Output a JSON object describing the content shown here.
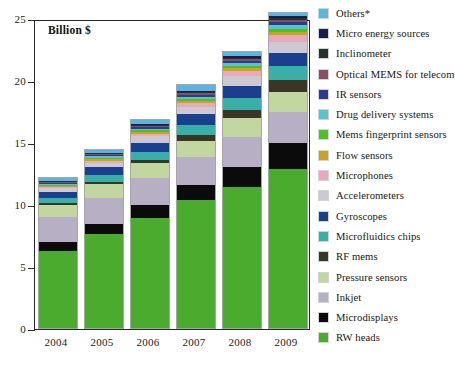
{
  "chart_data": {
    "type": "bar",
    "stacked": true,
    "title": "",
    "annotation": "Billion $",
    "xlabel": "",
    "ylabel": "",
    "ylim": [
      0,
      25
    ],
    "yticks": [
      0,
      5,
      10,
      15,
      20,
      25
    ],
    "ytick_labels": [
      "0",
      "5",
      "10",
      "15",
      "20",
      "25"
    ],
    "grid": true,
    "legend_position": "right",
    "legend_order_top_to_bottom": [
      "Others*",
      "Micro energy sources",
      "Inclinometer",
      "Optical MEMS for telecom",
      "IR sensors",
      "Drug delivery systems",
      "Mems fingerprint sensors",
      "Flow sensors",
      "Microphones",
      "Accelerometers",
      "Gyroscopes",
      "Microfluidics chips",
      "RF mems",
      "Pressure sensors",
      "Inkjet",
      "Microdisplays",
      "RW heads"
    ],
    "categories": [
      "2004",
      "2005",
      "2006",
      "2007",
      "2008",
      "2009"
    ],
    "totals": [
      12.1,
      14.4,
      16.8,
      19.5,
      22.2,
      25.1
    ],
    "series": [
      {
        "name": "RW heads",
        "color": "#4aab2e",
        "values": [
          6.2,
          7.6,
          8.9,
          10.3,
          11.4,
          12.8
        ]
      },
      {
        "name": "Microdisplays",
        "color": "#0b0b0b",
        "values": [
          0.75,
          0.8,
          1.0,
          1.2,
          1.6,
          2.1
        ]
      },
      {
        "name": "Inkjet",
        "color": "#b7b0c4",
        "values": [
          2.0,
          2.1,
          2.2,
          2.3,
          2.4,
          2.5
        ]
      },
      {
        "name": "Pressure sensors",
        "color": "#c2d6a0",
        "values": [
          1.0,
          1.1,
          1.2,
          1.3,
          1.5,
          1.6
        ]
      },
      {
        "name": "RF mems",
        "color": "#3b3525",
        "values": [
          0.12,
          0.2,
          0.25,
          0.45,
          0.7,
          1.0
        ]
      },
      {
        "name": "Microfluidics chips",
        "color": "#38b0a8",
        "values": [
          0.45,
          0.55,
          0.65,
          0.8,
          0.95,
          1.1
        ]
      },
      {
        "name": "Gyroscopes",
        "color": "#1b3f8f",
        "values": [
          0.45,
          0.6,
          0.75,
          0.9,
          1.0,
          1.1
        ]
      },
      {
        "name": "Accelerometers",
        "color": "#cdc8d4",
        "values": [
          0.3,
          0.4,
          0.5,
          0.6,
          0.75,
          0.9
        ]
      },
      {
        "name": "Microphones",
        "color": "#e8a9bb",
        "values": [
          0.1,
          0.15,
          0.2,
          0.3,
          0.4,
          0.5
        ]
      },
      {
        "name": "Flow sensors",
        "color": "#c9a227",
        "values": [
          0.1,
          0.15,
          0.18,
          0.2,
          0.25,
          0.3
        ]
      },
      {
        "name": "Mems fingerprint sensors",
        "color": "#4fc01f",
        "values": [
          0.08,
          0.1,
          0.12,
          0.15,
          0.2,
          0.25
        ]
      },
      {
        "name": "Drug delivery systems",
        "color": "#55c4cf",
        "values": [
          0.08,
          0.1,
          0.12,
          0.15,
          0.2,
          0.28
        ]
      },
      {
        "name": "IR sensors",
        "color": "#2b3c90",
        "values": [
          0.1,
          0.12,
          0.15,
          0.18,
          0.2,
          0.25
        ]
      },
      {
        "name": "Optical MEMS for telecom",
        "color": "#8f4a66",
        "values": [
          0.05,
          0.07,
          0.1,
          0.12,
          0.15,
          0.18
        ]
      },
      {
        "name": "Inclinometer",
        "color": "#25352c",
        "values": [
          0.05,
          0.06,
          0.08,
          0.1,
          0.12,
          0.15
        ]
      },
      {
        "name": "Micro energy sources",
        "color": "#1a1f4a",
        "values": [
          0.05,
          0.06,
          0.08,
          0.1,
          0.13,
          0.18
        ]
      },
      {
        "name": "Others*",
        "color": "#5ab5e0",
        "values": [
          0.2,
          0.24,
          0.3,
          0.42,
          0.35,
          0.21
        ]
      }
    ]
  }
}
